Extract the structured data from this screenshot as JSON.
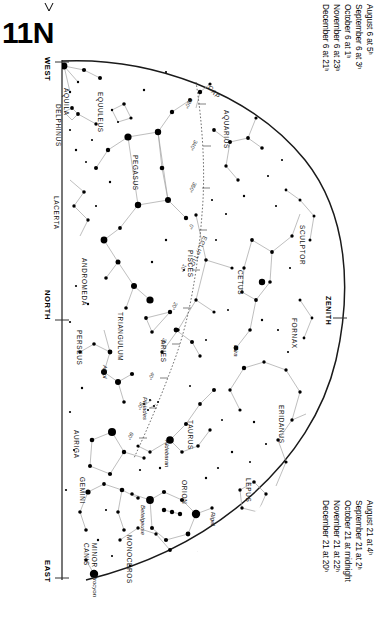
{
  "chart": {
    "number": "11N",
    "hemisphere_note": "N",
    "corner_mark": "tick"
  },
  "cardinals": [
    {
      "label": "WEST",
      "x": 52,
      "y": 57
    },
    {
      "label": "NORTH",
      "x": 52,
      "y": 290
    },
    {
      "label": "EAST",
      "x": 52,
      "y": 568
    }
  ],
  "zenith": {
    "label": "ZENITH",
    "x": 333,
    "y": 300
  },
  "dates_top": [
    "August 6 at  5ʰ",
    "September 6 at  3ʰ",
    "October 6 at  1ʰ",
    "November 6 at 23ʰ",
    "December 6 at 21ʰ"
  ],
  "dates_bottom": [
    "August 21 at  4ʰ",
    "September 21 at  2ʰ",
    "October 21 at midnight",
    "November 21 at 22ʰ",
    "December 21 at 20ʰ"
  ],
  "colors": {
    "ink": "#000000",
    "line": "#8a8a8a",
    "horizon": "#1a1a1a",
    "ecliptic": "#5a5a5a",
    "background": "#ffffff"
  },
  "constellations": [
    {
      "name": "AQUILA",
      "x": 70,
      "y": 88,
      "rot": 90
    },
    {
      "name": "DELPHINUS",
      "x": 62,
      "y": 104,
      "rot": 90
    },
    {
      "name": "EQUULEUS",
      "x": 104,
      "y": 92,
      "rot": 90
    },
    {
      "name": "PEGASUS",
      "x": 139,
      "y": 155,
      "rot": 90
    },
    {
      "name": "LACERTA",
      "x": 60,
      "y": 196,
      "rot": 90
    },
    {
      "name": "ANDROMEDA",
      "x": 88,
      "y": 258,
      "rot": 90
    },
    {
      "name": "TRIANGULUM",
      "x": 124,
      "y": 312,
      "rot": 90
    },
    {
      "name": "PERSEUS",
      "x": 83,
      "y": 330,
      "rot": 90
    },
    {
      "name": "ARIES",
      "x": 167,
      "y": 340,
      "rot": 90
    },
    {
      "name": "PISCES",
      "x": 194,
      "y": 250,
      "rot": 90
    },
    {
      "name": "CETUS",
      "x": 244,
      "y": 270,
      "rot": 90
    },
    {
      "name": "AQUARIUS",
      "x": 230,
      "y": 110,
      "rot": 90
    },
    {
      "name": "CAP",
      "x": 212,
      "y": 84,
      "rot": 50
    },
    {
      "name": "SCULPTOR",
      "x": 306,
      "y": 225,
      "rot": 90
    },
    {
      "name": "FORNAX",
      "x": 298,
      "y": 318,
      "rot": 90
    },
    {
      "name": "ERIDANUS",
      "x": 285,
      "y": 405,
      "rot": 90
    },
    {
      "name": "TAURUS",
      "x": 194,
      "y": 420,
      "rot": 90
    },
    {
      "name": "AURIGA",
      "x": 80,
      "y": 430,
      "rot": 90
    },
    {
      "name": "GEMINI",
      "x": 86,
      "y": 477,
      "rot": 90
    },
    {
      "name": "ORION",
      "x": 188,
      "y": 480,
      "rot": 90
    },
    {
      "name": "LEPUS",
      "x": 252,
      "y": 478,
      "rot": 90
    },
    {
      "name": "MONOCEROS",
      "x": 133,
      "y": 535,
      "rot": 90
    },
    {
      "name": "CANIS\nMINOR",
      "x": 90,
      "y": 543,
      "rot": 90
    }
  ],
  "named_stars": [
    {
      "name": "Algol",
      "x": 108,
      "y": 365
    },
    {
      "name": "Mira",
      "x": 239,
      "y": 345
    },
    {
      "name": "Pleiades",
      "x": 148,
      "y": 397
    },
    {
      "name": "Aldebaran",
      "x": 170,
      "y": 440
    },
    {
      "name": "Betelgeuse",
      "x": 146,
      "y": 505
    },
    {
      "name": "Rigel",
      "x": 216,
      "y": 512
    },
    {
      "name": "Procyon",
      "x": 98,
      "y": 575
    }
  ],
  "ecliptic": {
    "label": "ECLIPTIC",
    "degree_ticks": [
      "330°",
      "340°",
      "350°",
      "0°",
      "10°",
      "20°",
      "30°",
      "40°",
      "50°",
      "60°",
      "70°",
      "80°"
    ]
  },
  "chart_data": {
    "type": "scatter",
    "title": "11N",
    "xlabel": "",
    "ylabel": "",
    "legend": [
      "ECLIPTIC"
    ],
    "grid": false
  }
}
